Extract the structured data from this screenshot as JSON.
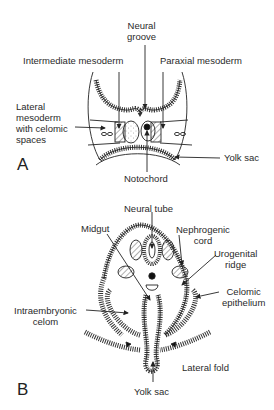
{
  "panel_a": {
    "letter": "A",
    "labels": {
      "neural_groove_1": "Neural",
      "neural_groove_2": "groove",
      "intermediate_mesoderm": "Intermediate mesoderm",
      "paraxial_mesoderm": "Paraxial mesoderm",
      "lateral_1": "Lateral",
      "lateral_2": "mesoderm",
      "lateral_3": "with celomic",
      "lateral_4": "spaces",
      "yolk_sac": "Yolk sac",
      "notochord": "Notochord"
    }
  },
  "panel_b": {
    "letter": "B",
    "labels": {
      "neural_tube": "Neural tube",
      "midgut": "Midgut",
      "nephrogenic_1": "Nephrogenic",
      "nephrogenic_2": "cord",
      "urogenital_1": "Urogenital",
      "urogenital_2": "ridge",
      "celomic_1": "Celomic",
      "celomic_2": "epithelium",
      "intraembryonic_1": "Intraembryonic",
      "intraembryonic_2": "celom",
      "lateral_fold": "Lateral fold",
      "yolk_sac": "Yolk sac"
    }
  }
}
